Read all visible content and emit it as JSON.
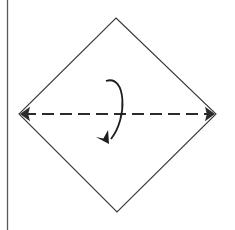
{
  "figure": {
    "type": "origami-fold-diagram",
    "caption": "",
    "canvas": {
      "width": 235,
      "height": 230,
      "background": "#ffffff"
    },
    "colors": {
      "shape_stroke": "#3a3a3a",
      "fold_line": "#2b2b2b",
      "arrow": "#1e1e1e",
      "page_border": "#5a5a5a",
      "paper_fill": "#ffffff"
    },
    "page_border": {
      "name": "page-edge-rule",
      "orientation": "vertical",
      "x": 7.5,
      "y1": 0,
      "y2": 230,
      "width": 1.3
    },
    "paper": {
      "name": "square-sheet-rotated",
      "shape": "diamond",
      "stroke_width": 1.1,
      "vertices": [
        {
          "label": "top",
          "x": 116,
          "y": 18
        },
        {
          "label": "right",
          "x": 216,
          "y": 114
        },
        {
          "label": "bottom",
          "x": 117,
          "y": 212
        },
        {
          "label": "left",
          "x": 19,
          "y": 114
        }
      ]
    },
    "fold_line": {
      "name": "horizontal-fold-crease",
      "style": "dashed",
      "dash_length": 12,
      "gap_length": 6,
      "stroke_width": 2,
      "x1": 24,
      "x2": 211,
      "y": 114,
      "arrowheads": "both-ends",
      "arrowhead_size": 10
    },
    "fold_arrow": {
      "name": "fold-direction-arrow",
      "description": "curved arrow sweeping from upper-left over to the right and down through the crease",
      "direction": "down",
      "stroke_width": 1.8,
      "start": {
        "x": 106,
        "y": 81
      },
      "control_1": {
        "x": 126,
        "y": 74
      },
      "control_2": {
        "x": 128,
        "y": 118
      },
      "end": {
        "x": 111,
        "y": 139
      },
      "arrowhead_size": 11,
      "arrowhead_angle_deg": 225
    }
  }
}
